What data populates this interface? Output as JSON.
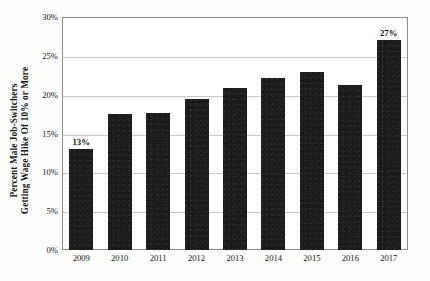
{
  "chart_data": {
    "type": "bar",
    "title": "",
    "subtitle": "",
    "xlabel": "",
    "ylabel_lines": [
      "Percent Male Job-Switchers",
      "Getting Wage Hike Of 10% or More"
    ],
    "ylabel": "Percent Male Job-Switchers Getting Wage Hike Of 10% or More",
    "categories": [
      "2009",
      "2010",
      "2011",
      "2012",
      "2013",
      "2014",
      "2015",
      "2016",
      "2017"
    ],
    "values": [
      13.0,
      17.5,
      17.7,
      19.5,
      20.8,
      22.2,
      22.9,
      21.3,
      27.0
    ],
    "ylim": [
      0,
      30
    ],
    "ytick_values": [
      0,
      5,
      10,
      15,
      20,
      25,
      30
    ],
    "ytick_labels": [
      "0%",
      "5%",
      "10%",
      "15%",
      "20%",
      "25%",
      "30%"
    ],
    "grid": true,
    "legend": "none",
    "bar_color": "#1b1b1b",
    "annotations": [
      {
        "category": "2009",
        "label": "13%"
      },
      {
        "category": "2017",
        "label": "27%"
      }
    ],
    "point_labels": [
      "13%",
      "",
      "",
      "",
      "",
      "",
      "",
      "",
      "27%"
    ]
  }
}
